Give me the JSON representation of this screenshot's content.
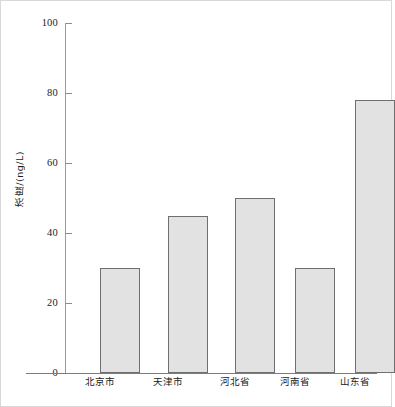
{
  "chart_data": {
    "type": "bar",
    "title": "",
    "subtitle": "",
    "xlabel": "",
    "ylabel": "浓度/(ng/L)",
    "categories": [
      "北京市",
      "天津市",
      "河北省",
      "河南省",
      "山东省"
    ],
    "values": [
      30,
      45,
      50,
      30,
      78
    ],
    "ylim": [
      0,
      100
    ],
    "yticks": [
      0,
      20,
      40,
      60,
      80,
      100
    ],
    "ytick_labels": [
      "0",
      "20",
      "40",
      "60",
      "80",
      "100"
    ],
    "grid": false,
    "legend": null,
    "legend_position": "none",
    "annotations": [],
    "series": [
      {
        "name": "浓度",
        "values": [
          30,
          45,
          50,
          30,
          78
        ]
      }
    ]
  },
  "style": {
    "bar_fill": "#e2e2e2",
    "bar_edge": "#6f6f6f",
    "axis_color": "#8c8c8c",
    "text_color": "#1a1a1a",
    "background": "#ffffff",
    "frame_color": "#d8d8d8"
  }
}
